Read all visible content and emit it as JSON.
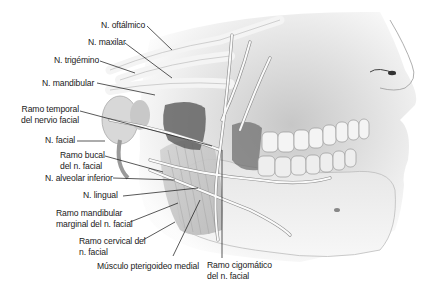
{
  "figure": {
    "labels": [
      {
        "id": "n-oftalmico",
        "text": "N. oftálmico"
      },
      {
        "id": "n-maxilar",
        "text": "N. maxilar"
      },
      {
        "id": "n-trigemino",
        "text": "N. trigémino"
      },
      {
        "id": "n-mandibular",
        "text": "N. mandibular"
      },
      {
        "id": "ramo-temporal",
        "line1": "Ramo temporal",
        "line2": "del nervio facial"
      },
      {
        "id": "n-facial",
        "text": "N. facial"
      },
      {
        "id": "ramo-bucal",
        "line1": "Ramo bucal",
        "line2": "del n. facial"
      },
      {
        "id": "n-alveolar-inferior",
        "text": "N. alveolar inferior"
      },
      {
        "id": "n-lingual",
        "text": "N. lingual"
      },
      {
        "id": "ramo-mandibular-marginal",
        "line1": "Ramo mandibular",
        "line2": "marginal del n. facial"
      },
      {
        "id": "ramo-cervical",
        "line1": "Ramo cervical del",
        "line2": "n. facial"
      },
      {
        "id": "musculo-pterigoideo",
        "text": "Músculo pterigoideo medial"
      },
      {
        "id": "ramo-cigomatico",
        "line1": "Ramo cigomático",
        "line2": "del n. facial"
      }
    ]
  }
}
